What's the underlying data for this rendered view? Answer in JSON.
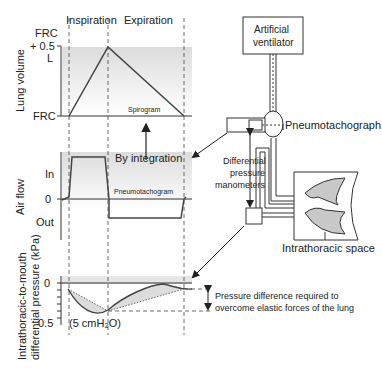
{
  "phases": {
    "inspiration": "Inspiration",
    "expiration": "Expiration"
  },
  "lung_volume": {
    "axis_label": "Lung volume",
    "tick_top_1": "FRC",
    "tick_top_2": "+ 0.5",
    "tick_top_3": "L",
    "tick_bottom": "FRC",
    "curve_label": "Spirogram"
  },
  "air_flow": {
    "axis_label": "Air flow",
    "tick_in": "In",
    "tick_zero": "0",
    "tick_out": "Out",
    "curve_label": "Pneumotachogram"
  },
  "pressure": {
    "axis_label_1": "Intrathoracic-to-mouth",
    "axis_label_2": "differential pressure (kPa)",
    "tick_zero": "0",
    "tick_half": "0.5",
    "unit_note": "(5 cmH₂O)",
    "annotation_1": "Pressure difference required to",
    "annotation_2": "overcome elastic forces of the lung"
  },
  "integration_label": "By integration",
  "apparatus": {
    "ventilator_1": "Artificial",
    "ventilator_2": "ventilator",
    "pneumotachograph": "Pneumotachograph",
    "manometers_1": "Differential",
    "manometers_2": "pressure",
    "manometers_3": "manometers",
    "intrathoracic": "Intrathoracic space"
  },
  "colors": {
    "line": "#333333",
    "shade": "#e6e6e6",
    "lung": "#c8c8c8"
  }
}
